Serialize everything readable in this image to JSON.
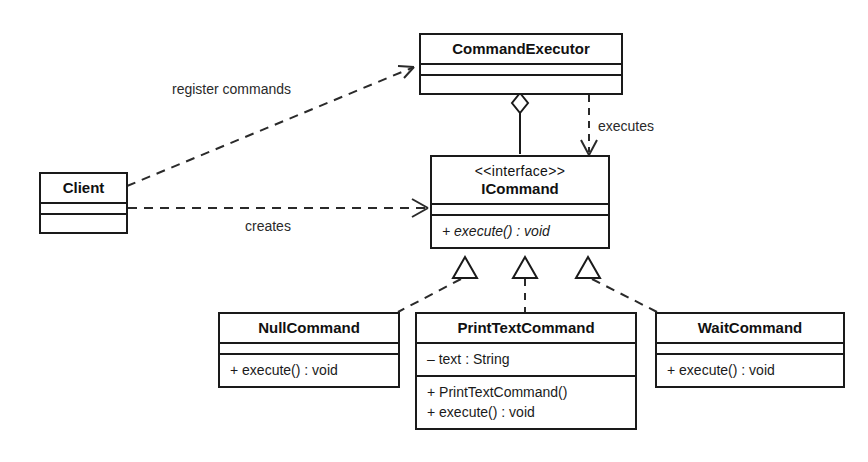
{
  "diagram": {
    "type": "uml-class-diagram",
    "background_color": "#ffffff",
    "line_color": "#1a1a1a"
  },
  "classes": {
    "client": {
      "name": "Client",
      "attributes": [],
      "methods": []
    },
    "command_executor": {
      "name": "CommandExecutor",
      "attributes": [],
      "methods": []
    },
    "icommand": {
      "stereotype": "<<interface>>",
      "name": "ICommand",
      "attributes": [],
      "methods": [
        "+ execute() : void"
      ]
    },
    "null_command": {
      "name": "NullCommand",
      "attributes": [],
      "methods": [
        "+ execute() : void"
      ]
    },
    "print_text_command": {
      "name": "PrintTextCommand",
      "attributes": [
        "– text : String"
      ],
      "methods": [
        "+ PrintTextCommand()",
        "+ execute() : void"
      ]
    },
    "wait_command": {
      "name": "WaitCommand",
      "attributes": [],
      "methods": [
        "+ execute() : void"
      ]
    }
  },
  "relationships": {
    "register_commands": {
      "label": "register commands",
      "kind": "dependency",
      "from": "Client",
      "to": "CommandExecutor"
    },
    "creates": {
      "label": "creates",
      "kind": "dependency",
      "from": "Client",
      "to": "ICommand"
    },
    "executes": {
      "label": "executes",
      "kind": "dependency",
      "from": "CommandExecutor",
      "to": "ICommand"
    },
    "aggregation": {
      "label": "",
      "kind": "aggregation",
      "from": "CommandExecutor",
      "to": "ICommand"
    },
    "realization_null": {
      "label": "",
      "kind": "realization",
      "from": "NullCommand",
      "to": "ICommand"
    },
    "realization_print": {
      "label": "",
      "kind": "realization",
      "from": "PrintTextCommand",
      "to": "ICommand"
    },
    "realization_wait": {
      "label": "",
      "kind": "realization",
      "from": "WaitCommand",
      "to": "ICommand"
    }
  }
}
